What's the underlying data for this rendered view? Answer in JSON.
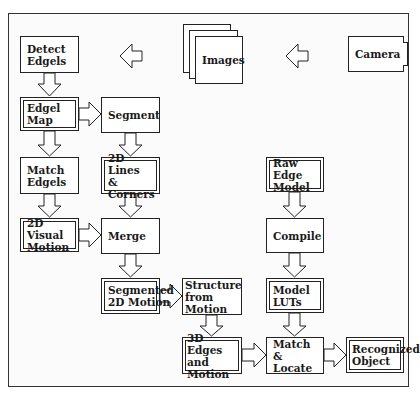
{
  "diagram": {
    "title": "",
    "nodes": [
      {
        "id": "camera",
        "label": "Camera",
        "style": "single"
      },
      {
        "id": "images",
        "label": "Images",
        "style": "stack"
      },
      {
        "id": "detect_edgels",
        "label": "Detect\nEdgels",
        "style": "single"
      },
      {
        "id": "edgel_map",
        "label": "Edgel Map",
        "style": "double"
      },
      {
        "id": "segment",
        "label": "Segment",
        "style": "single"
      },
      {
        "id": "match_edgels",
        "label": "Match\nEdgels",
        "style": "single"
      },
      {
        "id": "lines_corners",
        "label": "2D Lines\n& Corners",
        "style": "double"
      },
      {
        "id": "visual_motion",
        "label": "2D Visual\nMotion",
        "style": "double"
      },
      {
        "id": "merge",
        "label": "Merge",
        "style": "single"
      },
      {
        "id": "segmented_motion",
        "label": "Segmented\n2D Motion",
        "style": "double"
      },
      {
        "id": "structure_motion",
        "label": "Structure\nfrom Motion",
        "style": "single"
      },
      {
        "id": "edges_motion_3d",
        "label": "3D Edges\nand Motion",
        "style": "double"
      },
      {
        "id": "raw_edge_model",
        "label": "Raw Edge\nModel",
        "style": "double"
      },
      {
        "id": "compile",
        "label": "Compile",
        "style": "single"
      },
      {
        "id": "model_luts",
        "label": "Model\nLUTs",
        "style": "double"
      },
      {
        "id": "match_locate",
        "label": "Match &\nLocate",
        "style": "single"
      },
      {
        "id": "recognized_object",
        "label": "Recognized\nObject",
        "style": "double"
      }
    ],
    "edges": [
      [
        "camera",
        "images"
      ],
      [
        "images",
        "detect_edgels"
      ],
      [
        "detect_edgels",
        "edgel_map"
      ],
      [
        "edgel_map",
        "segment"
      ],
      [
        "edgel_map",
        "match_edgels"
      ],
      [
        "segment",
        "lines_corners"
      ],
      [
        "match_edgels",
        "visual_motion"
      ],
      [
        "lines_corners",
        "merge"
      ],
      [
        "visual_motion",
        "merge"
      ],
      [
        "merge",
        "segmented_motion"
      ],
      [
        "segmented_motion",
        "structure_motion"
      ],
      [
        "structure_motion",
        "edges_motion_3d"
      ],
      [
        "edges_motion_3d",
        "match_locate"
      ],
      [
        "raw_edge_model",
        "compile"
      ],
      [
        "compile",
        "model_luts"
      ],
      [
        "model_luts",
        "match_locate"
      ],
      [
        "match_locate",
        "recognized_object"
      ]
    ],
    "legend": {
      "double_border": "data",
      "single_border": "process"
    }
  }
}
